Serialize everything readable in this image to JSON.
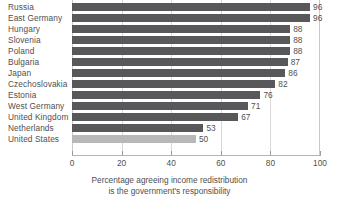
{
  "chart_data": {
    "type": "bar",
    "orientation": "horizontal",
    "title": "",
    "subtitle": "",
    "xlabel": "Percentage agreeing income redistribution is the government's responsibility",
    "ylabel": "",
    "xlim": [
      0,
      100
    ],
    "ylim": null,
    "xticks": [
      0,
      20,
      40,
      60,
      80,
      100
    ],
    "grid": "vertical-only",
    "legend": null,
    "categories": [
      "Russia",
      "East Germany",
      "Hungary",
      "Slovenia",
      "Poland",
      "Bulgaria",
      "Japan",
      "Czechoslovakia",
      "Estonia",
      "West Germany",
      "United Kingdom",
      "Netherlands",
      "United States"
    ],
    "values": [
      96,
      96,
      88,
      88,
      88,
      87,
      86,
      82,
      76,
      71,
      67,
      53,
      50
    ],
    "data_labels": [
      "96",
      "96",
      "88",
      "88",
      "88",
      "87",
      "86",
      "82",
      "76",
      "71",
      "67",
      "53",
      "50"
    ],
    "highlighted_category": "United States",
    "bar_colors": [
      "#58585a",
      "#58585a",
      "#58585a",
      "#58585a",
      "#58585a",
      "#58585a",
      "#58585a",
      "#58585a",
      "#58585a",
      "#58585a",
      "#58585a",
      "#58585a",
      "#b8b8b8"
    ]
  },
  "colors": {
    "bar_default": "#58585a",
    "bar_highlight": "#b8b8b8",
    "gridline": "#d8d8d8",
    "axis": "#b4b4b4",
    "text": "#4f4f4f",
    "background": "#ffffff"
  },
  "axis": {
    "tick_labels": [
      "0",
      "20",
      "40",
      "60",
      "80",
      "100"
    ]
  },
  "caption": {
    "line1": "Percentage agreeing income redistribution",
    "line2": "is the government's responsibility"
  }
}
